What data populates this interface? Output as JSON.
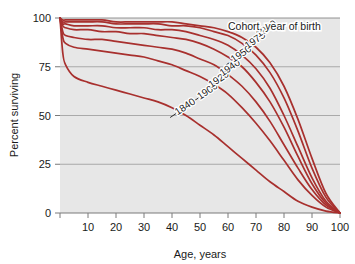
{
  "chart_data": {
    "type": "line",
    "title": "",
    "legend_title": "Cohort, year of birth",
    "legend_position": "top-right-inside",
    "xlabel": "Age, years",
    "ylabel": "Percent surviving",
    "xlim": [
      0,
      100
    ],
    "ylim": [
      0,
      100
    ],
    "xticks": [
      0,
      10,
      20,
      30,
      40,
      50,
      60,
      70,
      80,
      90,
      100
    ],
    "xtick_labels": [
      "",
      "10",
      "20",
      "30",
      "40",
      "50",
      "60",
      "70",
      "80",
      "90",
      "100"
    ],
    "yticks": [
      0,
      25,
      50,
      75,
      100
    ],
    "ytick_labels": [
      "0",
      "25",
      "50",
      "75",
      "100"
    ],
    "grid": "horizontal",
    "x": [
      0,
      1,
      2,
      5,
      10,
      15,
      20,
      25,
      30,
      35,
      40,
      45,
      50,
      55,
      60,
      65,
      70,
      75,
      80,
      85,
      90,
      95,
      100
    ],
    "series": [
      {
        "name": "1840",
        "label": "1840",
        "color": "#A8302E",
        "label_x": 42,
        "label_y": 50,
        "values": [
          100,
          82,
          76,
          70,
          67,
          65,
          63,
          61,
          59,
          57,
          54,
          50,
          45,
          40,
          34,
          28,
          22,
          16,
          11,
          6,
          3,
          1,
          0
        ]
      },
      {
        "name": "1900",
        "label": "1900",
        "color": "#A8302E",
        "label_x": 50,
        "label_y": 58,
        "values": [
          100,
          90,
          87,
          85,
          84,
          83,
          82,
          81,
          80,
          78,
          76,
          73,
          70,
          66,
          61,
          54,
          46,
          37,
          27,
          17,
          9,
          3,
          0
        ]
      },
      {
        "name": "1920",
        "label": "1920",
        "color": "#A8302E",
        "label_x": 54,
        "label_y": 64,
        "values": [
          100,
          93,
          91,
          90,
          89,
          89,
          88,
          87,
          86,
          85,
          84,
          82,
          79,
          76,
          71,
          65,
          57,
          47,
          35,
          23,
          12,
          4,
          0
        ]
      },
      {
        "name": "1940",
        "label": "1940",
        "color": "#A8302E",
        "label_x": 58,
        "label_y": 70,
        "values": [
          100,
          96,
          95,
          94,
          94,
          93,
          93,
          92,
          92,
          91,
          90,
          89,
          87,
          84,
          80,
          75,
          67,
          57,
          44,
          29,
          15,
          5,
          0
        ]
      },
      {
        "name": "1950",
        "label": "1950",
        "color": "#A8302E",
        "label_x": 62,
        "label_y": 77,
        "values": [
          100,
          97,
          97,
          96,
          96,
          96,
          95,
          95,
          95,
          94,
          94,
          93,
          91,
          89,
          86,
          81,
          74,
          64,
          50,
          34,
          18,
          6,
          0
        ]
      },
      {
        "name": "1975",
        "label": "1975",
        "color": "#A8302E",
        "label_x": 67,
        "label_y": 84,
        "values": [
          100,
          98,
          98,
          98,
          98,
          98,
          97,
          97,
          97,
          97,
          96,
          96,
          95,
          93,
          91,
          87,
          81,
          72,
          59,
          42,
          23,
          8,
          0
        ]
      },
      {
        "name": "1980",
        "label": "1980",
        "color": "#A8302E",
        "label_x": 71,
        "label_y": 90,
        "values": [
          100,
          99,
          99,
          99,
          99,
          99,
          98,
          98,
          98,
          98,
          98,
          97,
          96,
          95,
          93,
          90,
          85,
          77,
          65,
          48,
          28,
          10,
          0
        ]
      }
    ]
  },
  "colors": {
    "curve": "#A8302E",
    "plot_background": "#E7E7E7",
    "gridline": "#9a9a9a",
    "axis": "#7a7a7a",
    "text": "#1a1a1a",
    "page_background": "#ffffff"
  }
}
